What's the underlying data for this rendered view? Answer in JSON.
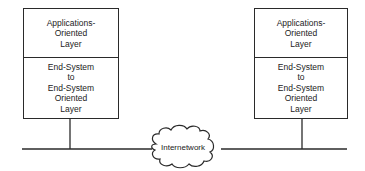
{
  "diagram": {
    "type": "network-architecture",
    "hosts": [
      {
        "id": "left-host",
        "layers": [
          {
            "label": "Applications-\nOriented\nLayer"
          },
          {
            "label": "End-System\nto\nEnd-System\nOriented\nLayer"
          }
        ]
      },
      {
        "id": "right-host",
        "layers": [
          {
            "label": "Applications-\nOriented\nLayer"
          },
          {
            "label": "End-System\nto\nEnd-System\nOriented\nLayer"
          }
        ]
      }
    ],
    "network": {
      "label": "Internetwork"
    },
    "colors": {
      "line": "#2a2a2a",
      "background": "#ffffff"
    }
  }
}
